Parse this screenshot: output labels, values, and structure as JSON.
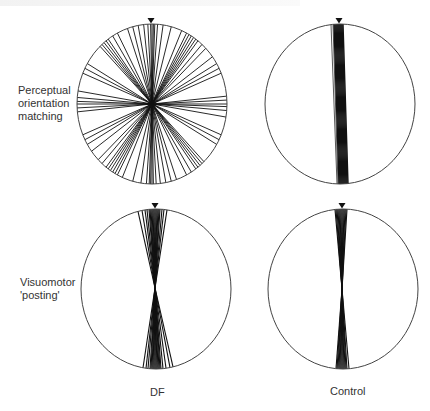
{
  "figure": {
    "row_labels": [
      "Perceptual orientation matching",
      "Visuomotor 'posting'"
    ],
    "row_label_lines": [
      [
        "Perceptual",
        "orientation",
        "matching"
      ],
      [
        "Visuomotor",
        "'posting'"
      ]
    ],
    "col_labels": [
      "DF",
      "Control"
    ],
    "line_color": "#111111",
    "circle_color": "#444444"
  },
  "chart_data": {
    "type": "polar-line-plot",
    "title": "",
    "rows": [
      "Perceptual orientation matching",
      "Visuomotor 'posting'"
    ],
    "columns": [
      "DF",
      "Control"
    ],
    "panels": [
      {
        "row": "Perceptual orientation matching",
        "column": "DF",
        "center": [
          152,
          104
        ],
        "rx": 75,
        "ry": 80,
        "style": "diameters",
        "angles_deg": [
          -88,
          -85,
          -80,
          -66,
          -62,
          -58,
          -42,
          -40,
          -38,
          -36,
          -34,
          -30,
          -26,
          -18,
          -14,
          -10,
          -6,
          -3,
          -1,
          0,
          1,
          2,
          4,
          8,
          14,
          22,
          26,
          28,
          30,
          32,
          34,
          36,
          40,
          44,
          52,
          58,
          62,
          66,
          84,
          87,
          90
        ]
      },
      {
        "row": "Perceptual orientation matching",
        "column": "Control",
        "center": [
          340,
          104
        ],
        "rx": 75,
        "ry": 80,
        "style": "band",
        "top_xs": [
          331,
          333,
          334,
          335,
          336,
          337,
          338,
          339,
          340,
          341,
          342,
          343
        ],
        "bottom_xs": [
          337,
          338,
          339,
          340,
          341,
          342,
          343,
          344,
          345,
          346,
          347,
          348
        ]
      },
      {
        "row": "Visuomotor 'posting'",
        "column": "DF",
        "center": [
          156,
          289
        ],
        "rx": 75,
        "ry": 80,
        "style": "fan",
        "cross": [
          155,
          288
        ],
        "top_xs": [
          138,
          142,
          145,
          147,
          149,
          150,
          151,
          152,
          153,
          154,
          155,
          156,
          157,
          158,
          159,
          160,
          162,
          164,
          167
        ],
        "bottom_xs": [
          143,
          146,
          148,
          150,
          151,
          152,
          153,
          154,
          155,
          156,
          157,
          158,
          159,
          160,
          161,
          163,
          166,
          170,
          173
        ]
      },
      {
        "row": "Visuomotor 'posting'",
        "column": "Control",
        "center": [
          343,
          289
        ],
        "rx": 75,
        "ry": 80,
        "style": "fan",
        "cross": [
          342,
          289
        ],
        "top_xs": [
          335,
          336,
          337,
          338,
          339,
          340,
          341,
          342,
          343,
          344,
          345,
          346,
          347
        ],
        "bottom_xs": [
          336,
          337,
          338,
          339,
          340,
          341,
          342,
          343,
          344,
          345,
          346,
          347,
          349
        ]
      }
    ],
    "marker": "downward triangle at top of each circle"
  }
}
